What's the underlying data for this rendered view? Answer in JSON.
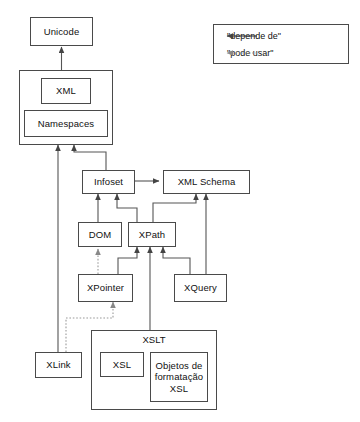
{
  "diagram": {
    "language": "pt-BR",
    "nodes": {
      "unicode": {
        "label": "Unicode"
      },
      "xml_container": {
        "label": ""
      },
      "xml": {
        "label": "XML"
      },
      "namespaces": {
        "label": "Namespaces"
      },
      "infoset": {
        "label": "Infoset"
      },
      "xml_schema": {
        "label": "XML Schema"
      },
      "dom": {
        "label": "DOM"
      },
      "xpath": {
        "label": "XPath"
      },
      "xpointer": {
        "label": "XPointer"
      },
      "xquery": {
        "label": "XQuery"
      },
      "xlink": {
        "label": "XLink"
      },
      "xslt": {
        "label": "XSLT"
      },
      "xsl": {
        "label": "XSL"
      },
      "xsl_fo": {
        "label": "Objetos de formatação XSL"
      }
    },
    "legend": {
      "items": [
        {
          "label": "\"depende de\"",
          "style": "solid",
          "icon": "solid-arrow-icon"
        },
        {
          "label": "\"pode usar\"",
          "style": "dotted",
          "icon": "dotted-arrow-icon"
        }
      ]
    },
    "edges": [
      {
        "from": "xml_container",
        "to": "unicode",
        "style": "solid",
        "relation": "depende de"
      },
      {
        "from": "infoset",
        "to": "xml_container",
        "style": "solid",
        "relation": "depende de"
      },
      {
        "from": "xlink",
        "to": "xml_container",
        "style": "solid",
        "relation": "depende de"
      },
      {
        "from": "infoset",
        "to": "xml_schema",
        "style": "solid",
        "relation": "depende de",
        "bidirectional": true
      },
      {
        "from": "dom",
        "to": "infoset",
        "style": "solid",
        "relation": "depende de"
      },
      {
        "from": "xpath",
        "to": "infoset",
        "style": "solid",
        "relation": "depende de"
      },
      {
        "from": "xquery",
        "to": "xml_schema",
        "style": "solid",
        "relation": "depende de"
      },
      {
        "from": "xpath",
        "to": "xml_schema",
        "style": "solid",
        "relation": "depende de"
      },
      {
        "from": "xpointer",
        "to": "xpath",
        "style": "solid",
        "relation": "depende de"
      },
      {
        "from": "xslt",
        "to": "xpath",
        "style": "solid",
        "relation": "depende de"
      },
      {
        "from": "xquery",
        "to": "xpath",
        "style": "solid",
        "relation": "depende de"
      },
      {
        "from": "xpointer",
        "to": "dom",
        "style": "dotted",
        "relation": "pode usar"
      },
      {
        "from": "xlink",
        "to": "xpointer",
        "style": "dotted",
        "relation": "pode usar"
      }
    ],
    "caption": ""
  },
  "colors": {
    "stroke": "#4a4a4a",
    "line": "#555555",
    "dotted": "#9a9a9a",
    "text": "#111111",
    "background": "#ffffff"
  }
}
